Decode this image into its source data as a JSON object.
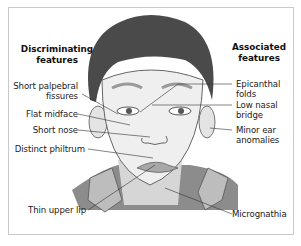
{
  "headings": {
    "left_line1": "Discriminating",
    "left_line2": "features",
    "right_line1": "Associated",
    "right_line2": "features"
  },
  "discriminating_features": [
    {
      "line1": "Short palpebral",
      "line2": "fissures"
    },
    {
      "line1": "Flat midface"
    },
    {
      "line1": "Short nose"
    },
    {
      "line1": "Distinct philtrum"
    },
    {
      "line1": "Thin upper lip"
    }
  ],
  "associated_features": [
    {
      "line1": "Epicanthal",
      "line2": "folds"
    },
    {
      "line1": "Low nasal",
      "line2": "bridge"
    },
    {
      "line1": "Minor ear",
      "line2": "anomalies"
    },
    {
      "line1": "Micrognathia"
    }
  ],
  "colors": {
    "hair": "#4a4a4a",
    "skin": "#efefef",
    "shirt": "#8a8a8a",
    "line": "#333333",
    "border": "#c9c9c9"
  }
}
